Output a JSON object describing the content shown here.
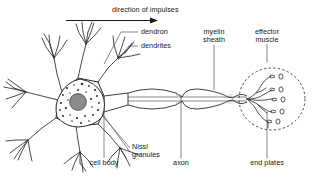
{
  "diagram": {
    "title_arrow": {
      "text": "direction of impulses",
      "arrow_icon": "arrow-right-icon"
    },
    "labels": {
      "dendron": "dendron",
      "dendrites": "dendrites",
      "myelin_sheath_l1": "myelin",
      "myelin_sheath_l2": "sheath",
      "effector_muscle_l1": "effector",
      "effector_muscle_l2": "muscle",
      "cell_body": "cell body",
      "nissl_l1": "Nissl",
      "nissl_l2": "granules",
      "axon": "axon",
      "end_plates": "end plates"
    },
    "colors": {
      "ink": "#1a1a1a",
      "stroke": "#2b2b2b",
      "nucleus_fill": "#8a8a8a",
      "nucleus_stroke": "#4a4a4a",
      "granule": "#2b2b2b",
      "background": "#ffffff",
      "leader": "#555555"
    },
    "structure": {
      "end_plate_count": 5,
      "myelin_segment_count": 3,
      "dendrite_branch_count": 6
    }
  }
}
